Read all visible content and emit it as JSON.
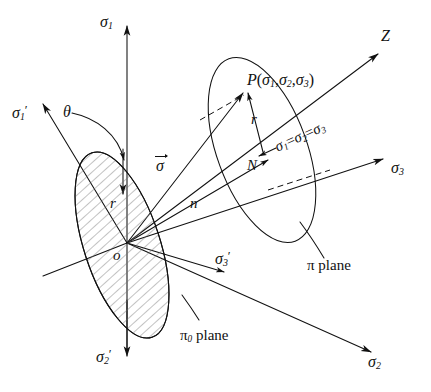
{
  "figure": {
    "kind": "stress-space-diagram",
    "background_color": "#ffffff",
    "line_color": "#111111"
  },
  "axes": [
    {
      "id": "sigma1",
      "label_html": "σ<sub>1</sub>",
      "text": "σ1",
      "direction": "up",
      "x": 108,
      "y": 22
    },
    {
      "id": "sigma2",
      "label_html": "σ<sub>2</sub>",
      "text": "σ2",
      "direction": "lower-right",
      "x": 377,
      "y": 360
    },
    {
      "id": "sigma3",
      "label_html": "σ<sub>3</sub>",
      "text": "σ3",
      "direction": "right",
      "x": 397,
      "y": 168
    },
    {
      "id": "sigma1prime",
      "label_html": "σ<sub>1</sub>′",
      "text": "σ1'",
      "direction": "upper-left",
      "x": 14,
      "y": 113
    },
    {
      "id": "sigma2prime",
      "label_html": "σ<sub>2</sub>′",
      "text": "σ2'",
      "direction": "down",
      "x": 103,
      "y": 357
    },
    {
      "id": "sigma3prime",
      "label_html": "σ<sub>3</sub>′",
      "text": "σ3'",
      "direction": "lower-right",
      "x": 216,
      "y": 252
    },
    {
      "id": "zaxis",
      "label_html": "Z",
      "text": "Z",
      "direction": "upper-right",
      "x": 386,
      "y": 36
    }
  ],
  "labels": {
    "origin": "o",
    "point_p": "P(σ₁,σ₂,σ₃)",
    "point_p_parts": {
      "name": "P",
      "open": "(",
      "s1": "σ",
      "sub1": "1",
      "s2": "σ",
      "sub2": "2",
      "s3": "σ",
      "sub3": "3",
      "close": ")"
    },
    "point_n": "N",
    "radius_pi": "r",
    "radius_pi0": "r",
    "normal_n": "n",
    "sigma_vector": "σ",
    "theta": "θ",
    "hydrostatic_axis": "σ₁=σ₂=σ₃",
    "pi_plane": "π plane",
    "pi0_plane": "π₀ plane",
    "pi_symbol": "π",
    "pi0_subscript": "0",
    "plane_word": "plane"
  },
  "geometry": {
    "origin_px": {
      "x": 127,
      "y": 243
    },
    "point_p_px": {
      "x": 247,
      "y": 90
    },
    "point_n_px": {
      "x": 265,
      "y": 153
    },
    "pi_plane_ellipse": {
      "cx": 262,
      "cy": 150,
      "rx": 45,
      "ry": 97,
      "rotation_deg": -20
    },
    "pi0_plane_ellipse": {
      "cx": 122,
      "cy": 245,
      "rx": 38,
      "ry": 97,
      "rotation_deg": -18,
      "hatched": true
    }
  }
}
